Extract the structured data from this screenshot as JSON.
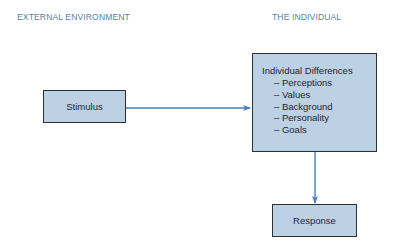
{
  "headings": {
    "left": "EXTERNAL ENVIRONMENT",
    "right": "THE INDIVIDUAL"
  },
  "nodes": {
    "stimulus": {
      "label": "Stimulus"
    },
    "individual": {
      "title": "Individual Differences",
      "items": [
        "– Perceptions",
        "– Values",
        "– Background",
        "– Personality",
        "– Goals"
      ]
    },
    "response": {
      "label": "Response"
    }
  },
  "edges": [
    {
      "from": "Stimulus",
      "to": "Individual Differences"
    },
    {
      "from": "Individual Differences",
      "to": "Response"
    }
  ],
  "colors": {
    "heading": "#5a7fa6",
    "box_fill": "#bdd1e4",
    "box_border": "#2b2f36",
    "arrow": "#4a7fbf"
  }
}
